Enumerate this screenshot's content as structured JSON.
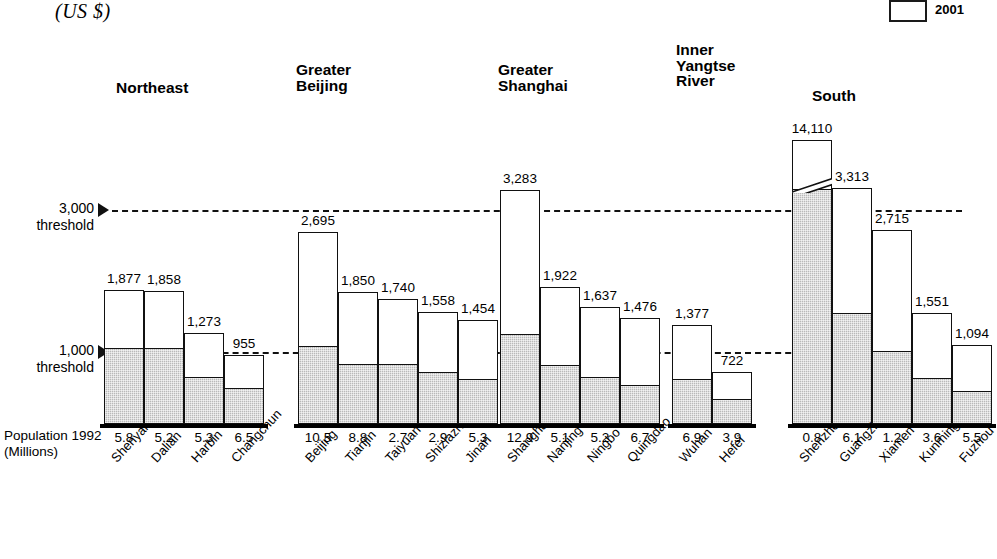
{
  "unit_label": "(US $)",
  "legend": {
    "items": [
      {
        "label": "2001",
        "swatch": "white-box"
      },
      {
        "label": "1992",
        "swatch": "gray-box"
      }
    ],
    "visible_label": "2001"
  },
  "axis": {
    "population_label": "Population 1992\n(Millions)",
    "threshold_high": "3,000\nthreshold",
    "threshold_low": "1,000\nthreshold"
  },
  "chart_data": {
    "type": "bar",
    "title": "",
    "subtitle": "",
    "xlabel": "",
    "ylabel": "(US $)",
    "ylim": [
      0,
      3600
    ],
    "grid": false,
    "legend_position": "top-right",
    "note": "Stacked two-period bar: gray lower segment = 1992 GDP per capita, white upper segment = 2001 GDP per capita (total bar height). Shenzhen bar is axis-broken.",
    "threshold_lines": [
      {
        "value": 3000,
        "label": "3,000 threshold"
      },
      {
        "value": 1000,
        "label": "1,000 threshold"
      }
    ],
    "groups": [
      {
        "name": "Northeast",
        "cities": [
          {
            "city": "Shenyang",
            "value_2001": 1877,
            "value_1992": 1043,
            "population_1992": 5.8
          },
          {
            "city": "Dalian",
            "value_2001": 1858,
            "value_1992": 1043,
            "population_1992": 5.2
          },
          {
            "city": "Harbin",
            "value_2001": 1273,
            "value_1992": 640,
            "population_1992": 5.3
          },
          {
            "city": "Changchun",
            "value_2001": 955,
            "value_1992": 485,
            "population_1992": 6.5
          }
        ]
      },
      {
        "name": "Greater\nBeijing",
        "cities": [
          {
            "city": "Beijing",
            "value_2001": 2695,
            "value_1992": 1070,
            "population_1992": 10.5
          },
          {
            "city": "Tianjin",
            "value_2001": 1850,
            "value_1992": 820,
            "population_1992": 8.8
          },
          {
            "city": "Taiyuan",
            "value_2001": 1740,
            "value_1992": 810,
            "population_1992": 2.7
          },
          {
            "city": "Shiziazhuang",
            "value_2001": 1558,
            "value_1992": 710,
            "population_1992": 2.9
          },
          {
            "city": "Jinan",
            "value_2001": 1454,
            "value_1992": 600,
            "population_1992": 5.3
          }
        ]
      },
      {
        "name": "Greater\nShanghai",
        "cities": [
          {
            "city": "Shanghai",
            "value_2001": 3283,
            "value_1992": 1240,
            "population_1992": 12.9
          },
          {
            "city": "Nanjing",
            "value_2001": 1922,
            "value_1992": 800,
            "population_1992": 5.1
          },
          {
            "city": "Ningbo",
            "value_2001": 1637,
            "value_1992": 640,
            "population_1992": 5.2
          },
          {
            "city": "Quingdao",
            "value_2001": 1476,
            "value_1992": 520,
            "population_1992": 6.7
          }
        ]
      },
      {
        "name": "Inner\nYangtse\nRiver",
        "cities": [
          {
            "city": "Wuhan",
            "value_2001": 1377,
            "value_1992": 600,
            "population_1992": 6.9
          },
          {
            "city": "Hefei",
            "value_2001": 722,
            "value_1992": 330,
            "population_1992": 3.9
          }
        ]
      },
      {
        "name": "South",
        "cities": [
          {
            "city": "Shenzhen",
            "value_2001": 14110,
            "value_1992": 3350,
            "population_1992": 0.8,
            "axis_break": true
          },
          {
            "city": "Guangzhou",
            "value_2001": 3313,
            "value_1992": 1540,
            "population_1992": 6.1
          },
          {
            "city": "Xiamen",
            "value_2001": 2715,
            "value_1992": 1000,
            "population_1992": 1.2
          },
          {
            "city": "Kunming",
            "value_2001": 1551,
            "value_1992": 620,
            "population_1992": 3.6
          },
          {
            "city": "Fuzhou",
            "value_2001": 1094,
            "value_1992": 430,
            "population_1992": 5.5
          }
        ]
      }
    ]
  },
  "layout": {
    "baseline_y": 424,
    "bar_width": 40,
    "group_x": [
      104,
      298,
      500,
      672,
      792
    ],
    "group_title_pos": [
      {
        "x": 116,
        "y": 80
      },
      {
        "x": 296,
        "y": 62
      },
      {
        "x": 498,
        "y": 62
      },
      {
        "x": 676,
        "y": 42
      },
      {
        "x": 812,
        "y": 88
      }
    ]
  }
}
